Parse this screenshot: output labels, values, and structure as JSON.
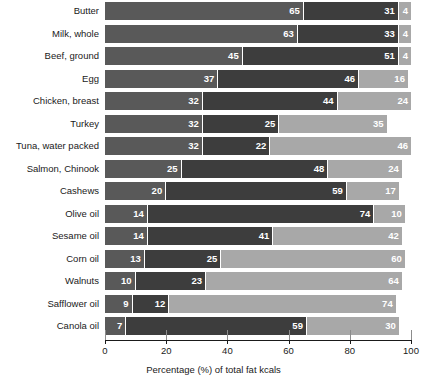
{
  "chart_data": {
    "type": "bar",
    "orientation": "horizontal",
    "stacked": true,
    "title": "",
    "xlabel": "Percentage (%) of total fat kcals",
    "ylabel": "",
    "xlim": [
      0,
      100
    ],
    "xticks": [
      0,
      20,
      40,
      60,
      80,
      100
    ],
    "grid": false,
    "legend": "none",
    "categories": [
      "Butter",
      "Milk, whole",
      "Beef, ground",
      "Egg",
      "Chicken, breast",
      "Turkey",
      "Tuna, water packed",
      "Salmon, Chinook",
      "Cashews",
      "Olive oil",
      "Sesame oil",
      "Corn oil",
      "Walnuts",
      "Safflower oil",
      "Canola oil"
    ],
    "series": [
      {
        "name": "segment-1",
        "color": "#595959",
        "values": [
          65,
          63,
          45,
          37,
          32,
          32,
          32,
          25,
          20,
          14,
          14,
          13,
          10,
          9,
          7
        ]
      },
      {
        "name": "segment-2",
        "color": "#3d3d3d",
        "values": [
          31,
          33,
          51,
          46,
          44,
          25,
          22,
          48,
          59,
          74,
          41,
          25,
          23,
          12,
          59
        ]
      },
      {
        "name": "segment-3",
        "color": "#a8a8a8",
        "values": [
          4,
          4,
          4,
          16,
          24,
          35,
          46,
          24,
          17,
          10,
          42,
          60,
          64,
          74,
          30
        ]
      }
    ]
  }
}
